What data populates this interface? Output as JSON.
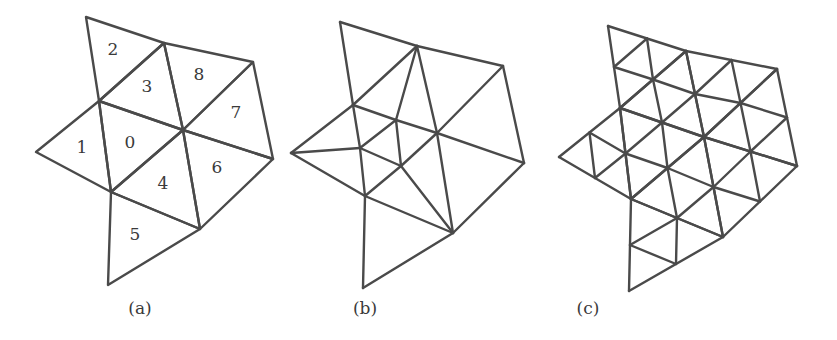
{
  "figure": {
    "stroke_color": "#4a4a4a",
    "text_color": "#3a3a3a",
    "background": "#ffffff"
  },
  "mesh": {
    "vertex_names": [
      "T",
      "A",
      "B",
      "C",
      "E",
      "F",
      "I",
      "J",
      "K",
      "L"
    ],
    "triangles": [
      {
        "id": "0",
        "v": [
          "C",
          "E",
          "J"
        ]
      },
      {
        "id": "1",
        "v": [
          "F",
          "C",
          "J"
        ]
      },
      {
        "id": "2",
        "v": [
          "T",
          "A",
          "C"
        ]
      },
      {
        "id": "3",
        "v": [
          "A",
          "E",
          "C"
        ]
      },
      {
        "id": "4",
        "v": [
          "J",
          "E",
          "K"
        ]
      },
      {
        "id": "5",
        "v": [
          "J",
          "K",
          "L"
        ]
      },
      {
        "id": "6",
        "v": [
          "E",
          "I",
          "K"
        ]
      },
      {
        "id": "7",
        "v": [
          "B",
          "I",
          "E"
        ]
      },
      {
        "id": "8",
        "v": [
          "A",
          "B",
          "E"
        ]
      }
    ]
  },
  "panels": [
    {
      "caption": "(a)",
      "caption_x": 140,
      "type": "base",
      "vertices": {
        "T": [
          86,
          17
        ],
        "A": [
          164,
          43
        ],
        "B": [
          253,
          62
        ],
        "C": [
          99,
          101
        ],
        "E": [
          183,
          130
        ],
        "F": [
          36,
          152
        ],
        "I": [
          273,
          159
        ],
        "J": [
          111,
          192
        ],
        "K": [
          200,
          229
        ],
        "L": [
          108,
          285
        ]
      },
      "labels": [
        {
          "text": "0",
          "x": 130,
          "y": 143
        },
        {
          "text": "1",
          "x": 82,
          "y": 148
        },
        {
          "text": "2",
          "x": 113,
          "y": 50
        },
        {
          "text": "3",
          "x": 147,
          "y": 87
        },
        {
          "text": "4",
          "x": 163,
          "y": 184
        },
        {
          "text": "5",
          "x": 135,
          "y": 235
        },
        {
          "text": "6",
          "x": 217,
          "y": 168
        },
        {
          "text": "7",
          "x": 236,
          "y": 113
        },
        {
          "text": "8",
          "x": 199,
          "y": 75
        }
      ]
    },
    {
      "caption": "(b)",
      "caption_x": 365,
      "type": "adaptive",
      "vertices": {
        "T": [
          340,
          22
        ],
        "A": [
          417,
          46
        ],
        "B": [
          503,
          66
        ],
        "C": [
          353,
          105
        ],
        "D": [
          396,
          120
        ],
        "E": [
          437,
          133
        ],
        "F": [
          291,
          153
        ],
        "G": [
          360,
          148
        ],
        "H": [
          401,
          166
        ],
        "I": [
          524,
          163
        ],
        "J": [
          365,
          196
        ],
        "K": [
          453,
          233
        ],
        "L": [
          363,
          288
        ]
      },
      "edges": [
        [
          "T",
          "A"
        ],
        [
          "T",
          "C"
        ],
        [
          "A",
          "B"
        ],
        [
          "A",
          "C"
        ],
        [
          "A",
          "D"
        ],
        [
          "A",
          "E"
        ],
        [
          "B",
          "E"
        ],
        [
          "B",
          "I"
        ],
        [
          "C",
          "F"
        ],
        [
          "C",
          "D"
        ],
        [
          "C",
          "G"
        ],
        [
          "D",
          "E"
        ],
        [
          "D",
          "G"
        ],
        [
          "D",
          "H"
        ],
        [
          "E",
          "I"
        ],
        [
          "E",
          "H"
        ],
        [
          "E",
          "K"
        ],
        [
          "F",
          "G"
        ],
        [
          "F",
          "J"
        ],
        [
          "G",
          "J"
        ],
        [
          "G",
          "H"
        ],
        [
          "H",
          "J"
        ],
        [
          "H",
          "K"
        ],
        [
          "J",
          "K"
        ],
        [
          "I",
          "K"
        ],
        [
          "J",
          "L"
        ],
        [
          "K",
          "L"
        ]
      ]
    },
    {
      "caption": "(c)",
      "caption_x": 588,
      "type": "uniform",
      "vertices": {
        "T": [
          608,
          26
        ],
        "A": [
          686,
          51
        ],
        "B": [
          777,
          69
        ],
        "C": [
          620,
          108
        ],
        "E": [
          704,
          137
        ],
        "F": [
          559,
          157
        ],
        "I": [
          797,
          166
        ],
        "J": [
          631,
          199
        ],
        "K": [
          723,
          237
        ],
        "L": [
          629,
          291
        ]
      }
    }
  ]
}
